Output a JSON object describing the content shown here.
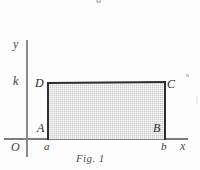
{
  "figure": {
    "caption": "Fig. 1",
    "bleed_text_top": "0",
    "axes": {
      "x_axis_label": "x",
      "y_axis_label": "y",
      "origin_label": "O",
      "y_tick_label": "k",
      "x_tick_labels": [
        "a",
        "b"
      ]
    },
    "vertices": {
      "bottom_left": "A",
      "bottom_right": "B",
      "top_right": "C",
      "top_left": "D"
    },
    "colors": {
      "fill": "#cfcfcf",
      "outline": "#2e2e2e",
      "axis": "#7d7d7d",
      "text": "#2c2c2c",
      "background": "#fdfdfd"
    }
  },
  "chart_data": {
    "type": "area",
    "title": "Fig. 1",
    "xlabel": "x",
    "ylabel": "y",
    "x": [
      "a",
      "b"
    ],
    "values": [
      "k",
      "k"
    ],
    "annotations": [
      {
        "label": "A",
        "x": "a",
        "y": "0"
      },
      {
        "label": "B",
        "x": "b",
        "y": "0"
      },
      {
        "label": "C",
        "x": "b",
        "y": "k"
      },
      {
        "label": "D",
        "x": "a",
        "y": "k"
      },
      {
        "label": "O",
        "x": "0",
        "y": "0"
      }
    ],
    "axis_ticks": {
      "x": [
        "a",
        "b"
      ],
      "y": [
        "k"
      ]
    },
    "grid": false,
    "legend": null
  }
}
